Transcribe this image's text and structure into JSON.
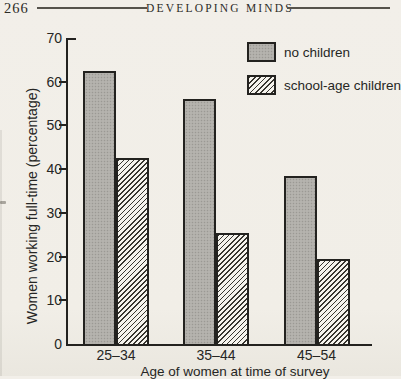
{
  "header": {
    "page_number": "266",
    "title": "DEVELOPING MINDS"
  },
  "chart_data": {
    "type": "bar",
    "categories": [
      "25–34",
      "35–44",
      "45–54"
    ],
    "series": [
      {
        "name": "no children",
        "fill": "solid-gray",
        "values": [
          62.5,
          56,
          38.5
        ]
      },
      {
        "name": "school-age children",
        "fill": "diagonal-hatch",
        "values": [
          42.5,
          25.5,
          19.5
        ]
      }
    ],
    "xlabel": "Age of women at time of survey",
    "ylabel": "Women working full-time (percentage)",
    "ylim": [
      0,
      70
    ],
    "yticks": [
      0,
      10,
      20,
      30,
      40,
      50,
      60,
      70
    ],
    "grid": false,
    "legend_position": "top-right",
    "colors": {
      "paper": "#f1eee7",
      "ink": "#23221f",
      "bar_gray": "#b5b3ae",
      "hatch_background": "#f5f3ed"
    }
  }
}
